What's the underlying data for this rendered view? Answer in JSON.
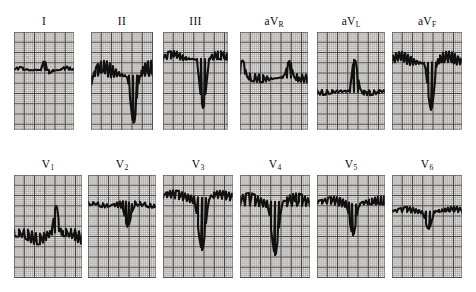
{
  "figure": {
    "kind": "ecg-12-lead",
    "background_color": "#ffffff",
    "paper_color": "#efece9",
    "grid_minor_color": "#8f8d8c",
    "grid_major_color": "#3a3838",
    "trace_color": "#111111",
    "grid_minor_px": 2.05,
    "grid_major_px": 10.25
  },
  "rows": [
    {
      "name": "limb-leads",
      "label_y": 16,
      "panel_y": 32,
      "panel_height": 98
    },
    {
      "name": "precordial-leads",
      "label_y": 159,
      "panel_y": 175,
      "panel_height": 103
    }
  ],
  "leads": [
    {
      "id": "I",
      "label": "I",
      "label_main": "I",
      "label_sub": "",
      "row": 0,
      "x": 14,
      "width": 60,
      "baseline": 38,
      "description": "flat isoelectric baseline with a small sharp R spike and low-amplitude T wave",
      "points": "0,38 4,37.5 9,37.6 13,36.8 17,37.8 21,37.3 24,37.6 27,37.2 29.5,29.5 31.5,30 33,38 35,41.5 37,40.4 39,39.3 41,38.6 44,38.4 47,37.2 50,35.4 53,34.6 56,35.6 59,37.4 62,38.2 66,38.1 70,38.0 74,38.1 78,38.0 82,38.1 86,38.0 90,38.1 94,38.0 98,38.1 102,38.0 106,38.1 110,38.0 114,38.1 118,38.0"
    },
    {
      "id": "II",
      "label": "II",
      "label_main": "II",
      "label_sub": "",
      "row": 0,
      "x": 91,
      "width": 62,
      "baseline": 44,
      "description": "deep QS complex reaching near the bottom of the panel with a broad upright T wave",
      "points": "0,44 4,43.8 7,43.4 10,40.6 12,39.2 14,41.2 17,44.6 20,45.4 23,45.0 26,44.4 29,44.2 32,44.6 34,44.4 36,45.4 37.5,52 39,66 40.5,80 41.5,88 42.5,91 43.5,90 44.5,82 46,66 47.5,52 49,44 50.5,39 52,35 54,31.6 57,29.4 60,28.6 63,29.2 66,31 69,34 72,37.4 75,40.2 78,42.2 81,43.4 85,43.8 89,44.0 93,43.9 97,44.0 101,43.9 105,44.0 109,43.9 113,44.0 117,43.9"
    },
    {
      "id": "III",
      "label": "III",
      "label_main": "III",
      "label_sub": "",
      "row": 0,
      "x": 163,
      "width": 65,
      "baseline": 27,
      "description": "high baseline with deep narrow QS complex and broad domed upright T wave",
      "points": "0,27.4 4,27.0 8,26.6 11,24.8 14,26.0 17,27.8 20,28.4 23,28.0 26,27.4 29,27.2 31,27.6 33,28.2 34.5,34 36,48 37.5,62 39,72 40,76 41,74 42.5,62 44,47 45.5,33 47,26 49,22.4 52,20.0 55,19.2 58,19.0 61,19.8 64,21.4 67,23.4 70,25.2 73,26.4 77,27.0 81,27.2 85,27.0 89,27.2 93,27.0 97,27.2 101,27.0 105,27.2 109,27.0 113,27.2 117,27.0 121,27.2"
    },
    {
      "id": "aVR",
      "label": "aVR",
      "label_main": "aV",
      "label_sub": "R",
      "row": 0,
      "x": 240,
      "width": 68,
      "baseline": 42,
      "description": "upright R wave of moderate height with a shallow inverted T wave",
      "points": "0,42 5,41.8 10,41.9 15,42.4 19,42.6 23,43.2 27,44.4 31,45.8 34,46.4 37,46.0 40,45.2 43,44.0 45,42.0 46.5,36 48,30.4 49.5,28.6 51,30.8 52.5,38 54,44.6 56,47.8 58,49.2 61,49.8 64,50.2 67,50.4 70,50.2 73,49.6 76,48.4 79,47.2 82,46.2 86,45.6 90,45.4 94,45.5 98,45.4 102,45.5 106,45.4 110,45.5 114,45.4 118,45.5 122,45.4 126,45.5"
    },
    {
      "id": "aVL",
      "label": "aVL",
      "label_main": "aV",
      "label_sub": "L",
      "row": 0,
      "x": 317,
      "width": 68,
      "baseline": 58,
      "description": "flat low baseline with a tall narrow R spike and nearly flat T wave",
      "points": "0,58.4 5,58.2 10,58.3 15,58.2 20,58.3 24,58.2 28,58.4 31,58.2 33,57.0 34.5,44 36,32 37,27.6 38.5,28.6 40,37 41.5,48 43,56 45,60.6 47,62.4 50,63.0 53,63.2 56,62.8 59,62.2 62,61.4 65,60.6 68,60.2 72,59.8 76,59.6 80,59.7 84,59.6 88,59.7 92,59.6 96,59.7 100,59.6 104,59.7 108,59.6 112,59.7 116,59.6 120,59.7 124,59.6"
    },
    {
      "id": "aVF",
      "label": "aVF",
      "label_main": "aV",
      "label_sub": "F",
      "row": 0,
      "x": 392,
      "width": 70,
      "baseline": 31,
      "description": "deep narrow QS complex with ST elevation and broad domed upright T wave",
      "points": "0,31.6 3,30.4 6,28.6 9,28.0 12,29.6 15,31.8 18,32.8 21,32.6 24,32.0 27,31.6 30,31.4 32,31.8 33.5,36 35,50 36.5,64 38,74 39,78 40,76 41.5,64 43,49 44.5,35 46,27.2 48,23.4 51,21.0 54,20.0 57,19.8 60,20.6 63,22.4 66,24.6 69,26.8 72,28.6 75,29.8 79,30.4 83,30.6 87,30.4 91,30.6 95,30.4 99,30.6 103,30.4 107,30.6 111,30.4 115,30.6 119,30.4 123,30.6 127,30.4"
    },
    {
      "id": "V1",
      "label": "V1",
      "label_main": "V",
      "label_sub": "1",
      "row": 0,
      "x": 14,
      "width": 68,
      "row_index": 1,
      "baseline": 54,
      "description": "flat baseline, shallow S dip, tall narrow R spike then deeply inverted T wave",
      "points": "0,54 5,54.1 10,54.0 14,54.4 18,56.2 22,58.0 26,58.6 30,58.0 33,57.0 36,56.2 38,54.4 39.5,44 41,34 42,31 43,32.5 44.5,44 46,55 47.5,60 49,61.4 52,61.2 55,61.8 58,63.2 61,65.2 64,67.2 67,68.6 70,69.4 73,69.2 76,67.8 79,65.4 82,62.4 85,59.8 88,57.8 92,56.6 96,56.2 100,56.3 104,56.2 108,56.3 112,56.2 116,56.3 120,56.2 124,56.3"
    },
    {
      "id": "V2",
      "label": "V2",
      "label_main": "V",
      "label_sub": "2",
      "row": 0,
      "x": 88,
      "width": 68,
      "row_index": 1,
      "baseline": 27,
      "description": "elevated baseline with a moderately deep narrow QS and small late positive T wave",
      "points": "0,26.4 5,26.8 10,27.4 15,28.2 19,29.2 23,30.4 27,31.6 30,32.4 33,33.0 35,34.6 36.5,41 38,48 39.5,52 41,50 42.5,44 44,37 46,32.4 49,30.0 52,29.0 55,29.6 58,31.0 61,32.2 64,32.6 67,32.0 70,30.8 73,29.2 76,27.8 79,26.8 82,26.4 85,26.8 88,27.8 91,29.2 94,30.2 97,30.8 101,31.0 105,30.9 109,31.0 113,30.9 117,31.0 121,30.9 125,31.0"
    },
    {
      "id": "V3",
      "label": "V3",
      "label_main": "V",
      "label_sub": "3",
      "row": 0,
      "x": 163,
      "width": 70,
      "row_index": 1,
      "baseline": 23,
      "description": "high baseline with a very deep narrow QS complex, marked ST elevation and broad T wave",
      "points": "0,22.6 4,22.4 8,22.8 12,23.6 16,24.4 20,25.4 24,26.4 27,27.4 30,28.4 32,29.6 33.5,38 35,52 36.5,64 38,72 39,75 40,73 41.5,62 43,48 44.5,34 46,25 48,20.0 51,17.2 54,16.0 57,15.6 60,15.8 63,16.4 66,17.4 69,18.6 72,19.8 75,20.8 78,21.6 82,22.2 86,22.6 90,22.8 94,22.6 98,22.8 102,22.6 106,22.8 110,22.6 114,22.8 118,22.6 122,22.8 126,22.6"
    },
    {
      "id": "V4",
      "label": "V4",
      "label_main": "V",
      "label_sub": "4",
      "row": 0,
      "x": 240,
      "width": 70,
      "row_index": 1,
      "baseline": 31,
      "description": "flat baseline then very deep narrow QS complex with ST elevation and rounded T wave",
      "points": "0,31.0 5,30.8 10,30.9 15,31.0 19,31.2 23,31.6 26,32.0 28,32.8 29.5,40 31,54 32.5,66 34,76 35,80 36,78 37.5,66 39,52 40.5,39 42,30 44,25.4 47,22.0 50,20.0 53,18.8 56,18.2 59,18.6 62,19.8 65,21.6 68,23.4 71,24.8 74,25.8 78,26.4 82,26.6 86,26.4 90,26.6 94,26.4 98,26.6 102,26.4 106,26.6 110,26.4 114,26.6 118,26.4 122,26.6 126,26.4"
    },
    {
      "id": "V5",
      "label": "V5",
      "label_main": "V",
      "label_sub": "5",
      "row": 0,
      "x": 317,
      "width": 68,
      "row_index": 1,
      "baseline": 29,
      "description": "baseline with moderately deep narrow QS complex and broad rounded T wave",
      "points": "0,29.2 5,28.8 10,28.6 14,28.8 18,29.4 22,30.4 25,31.2 28,31.6 30,32.4 31.5,38 33,48 34.5,56 36,60 37,58 38.5,50 40,40 41.5,32 43,28.6 46,26.6 49,25.6 52,24.8 55,23.8 58,22.8 61,22.0 64,21.6 67,21.8 70,22.6 73,24.0 76,25.8 79,27.4 82,28.6 86,29.4 90,29.8 94,29.6 98,29.8 102,29.6 106,29.8 110,29.6 114,29.8 118,29.6 122,29.8"
    },
    {
      "id": "V6",
      "label": "V6",
      "label_main": "V",
      "label_sub": "6",
      "row": 0,
      "x": 392,
      "width": 70,
      "row_index": 1,
      "baseline": 37,
      "description": "baseline with a shallow narrow QS complex and small rounded T wave",
      "points": "0,37.2 5,36.8 10,36.6 15,36.8 19,37.2 23,37.6 26,38.0 29,38.4 31,39.0 32.5,43 34,49 35.5,53 37,54 38,52 39.5,47 41,42 42.5,38 44,36.2 47,35.2 50,34.6 53,33.8 56,32.8 59,32.0 62,31.6 65,31.8 68,32.6 71,33.8 74,35.0 77,36.0 81,36.6 85,36.8 89,36.6 93,36.8 97,36.6 101,36.8 105,36.6 109,36.8 113,36.6 117,36.8 121,36.6 125,36.8"
    }
  ]
}
